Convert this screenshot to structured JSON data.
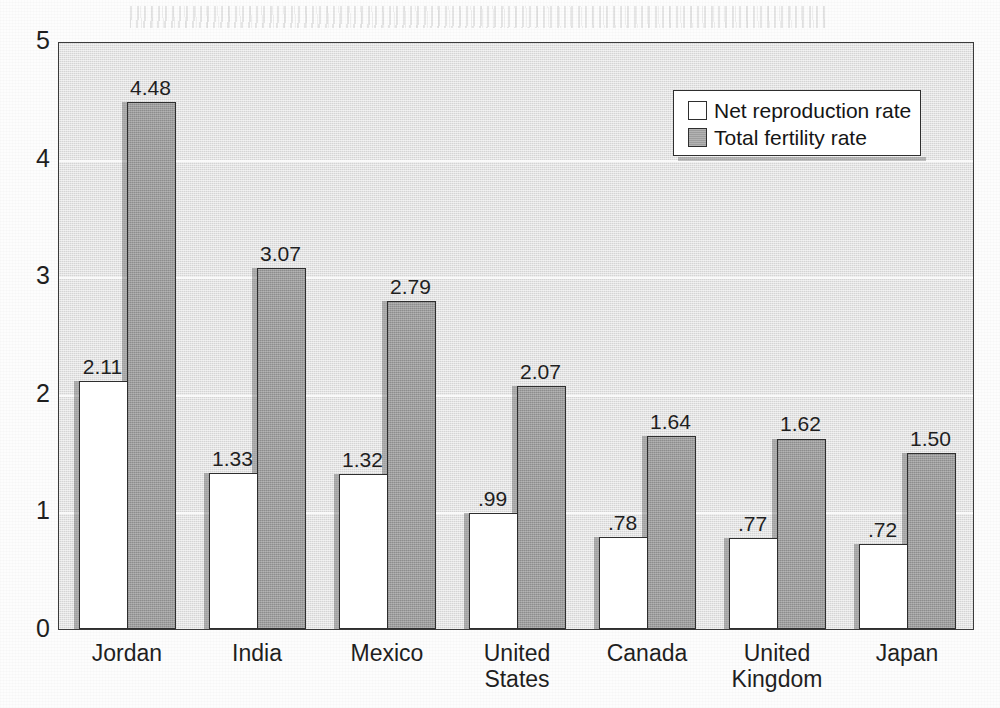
{
  "chart_data": {
    "type": "bar",
    "title": "",
    "subtitle": "",
    "xlabel": "",
    "ylabel": "",
    "ylim": [
      0,
      5
    ],
    "ytick_labels": [
      "0",
      "1",
      "2",
      "3",
      "4",
      "5"
    ],
    "ytick_values": [
      0,
      1,
      2,
      3,
      4,
      5
    ],
    "grid": true,
    "grid_axis": "y",
    "legend_position": "top-right",
    "categories": [
      "Jordan",
      "India",
      "Mexico",
      "United\nStates",
      "Canada",
      "United\nKingdom",
      "Japan"
    ],
    "series": [
      {
        "name": "Net reproduction rate",
        "swatch": "white",
        "values": [
          2.11,
          1.33,
          1.32,
          0.99,
          0.78,
          0.77,
          0.72
        ],
        "labels": [
          "2.11",
          "1.33",
          "1.32",
          ".99",
          ".78",
          ".77",
          ".72"
        ]
      },
      {
        "name": "Total fertility rate",
        "swatch": "gray",
        "values": [
          4.48,
          3.07,
          2.79,
          2.07,
          1.64,
          1.62,
          1.5
        ],
        "labels": [
          "4.48",
          "3.07",
          "2.79",
          "2.07",
          "1.64",
          "1.62",
          "1.50"
        ]
      }
    ]
  },
  "legend": {
    "items": [
      {
        "label": "Net reproduction rate",
        "swatch": "white"
      },
      {
        "label": "Total fertility rate",
        "swatch": "gray"
      }
    ]
  },
  "colors": {
    "plot_background": "#d4d4d4",
    "bar_nrr_fill": "#ffffff",
    "bar_tfr_fill": "#9d9d9d",
    "bar_outline": "#2e2e2e",
    "gridline": "#fbfbfb",
    "text": "#1f1f1f",
    "page_background": "#fdfdfd"
  }
}
